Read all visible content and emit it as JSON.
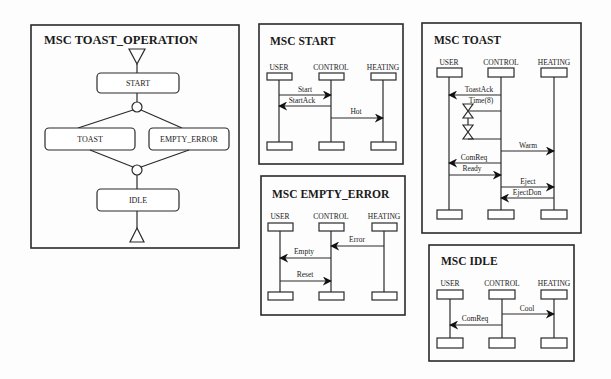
{
  "diagram": {
    "colors": {
      "ink": "#2a2a2a",
      "background": "#fdfdfd"
    },
    "hmsc": {
      "title": "MSC TOAST_OPERATION",
      "states": {
        "start": "START",
        "toast": "TOAST",
        "empty_error": "EMPTY_ERROR",
        "idle": "IDLE"
      }
    },
    "msc_start": {
      "title": "MSC START",
      "instances": [
        "USER",
        "CONTROL",
        "HEATING"
      ],
      "messages": [
        {
          "label": "Start",
          "from": "USER",
          "to": "CONTROL"
        },
        {
          "label": "StartAck",
          "from": "CONTROL",
          "to": "USER"
        },
        {
          "label": "Hot",
          "from": "CONTROL",
          "to": "HEATING"
        }
      ]
    },
    "msc_empty_error": {
      "title": "MSC EMPTY_ERROR",
      "instances": [
        "USER",
        "CONTROL",
        "HEATING"
      ],
      "messages": [
        {
          "label": "Error",
          "from": "HEATING",
          "to": "CONTROL"
        },
        {
          "label": "Empty",
          "from": "CONTROL",
          "to": "USER"
        },
        {
          "label": "Reset",
          "from": "USER",
          "to": "CONTROL"
        }
      ]
    },
    "msc_toast": {
      "title": "MSC TOAST",
      "instances": [
        "USER",
        "CONTROL",
        "HEATING"
      ],
      "timer_label": "Time(8)",
      "messages": [
        {
          "label": "ToastAck",
          "from": "CONTROL",
          "to": "USER"
        },
        {
          "label": "Warm",
          "from": "CONTROL",
          "to": "HEATING"
        },
        {
          "label": "ComReq",
          "from": "CONTROL",
          "to": "USER"
        },
        {
          "label": "Ready",
          "from": "USER",
          "to": "CONTROL"
        },
        {
          "label": "Eject",
          "from": "CONTROL",
          "to": "HEATING"
        },
        {
          "label": "EjectDon",
          "from": "HEATING",
          "to": "CONTROL"
        }
      ]
    },
    "msc_idle": {
      "title": "MSC IDLE",
      "instances": [
        "USER",
        "CONTROL",
        "HEATING"
      ],
      "messages": [
        {
          "label": "Cool",
          "from": "CONTROL",
          "to": "HEATING"
        },
        {
          "label": "ComReq",
          "from": "CONTROL",
          "to": "USER"
        }
      ]
    }
  }
}
